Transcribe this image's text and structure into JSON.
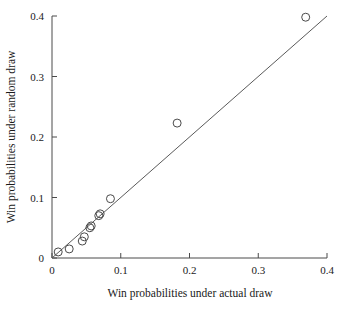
{
  "chart_data": {
    "type": "scatter",
    "title": "",
    "xlabel": "Win probabilities under actual draw",
    "ylabel": "Win probabilities under random draw",
    "xlim": [
      0,
      0.4
    ],
    "ylim": [
      0,
      0.4
    ],
    "xticks": [
      0,
      0.1,
      0.2,
      0.3,
      0.4
    ],
    "yticks": [
      0,
      0.1,
      0.2,
      0.3,
      0.4
    ],
    "xtick_labels": [
      "0",
      "0.1",
      "0.2",
      "0.3",
      "0.4"
    ],
    "ytick_labels": [
      "0",
      "0.1",
      "0.2",
      "0.3",
      "0.4"
    ],
    "grid": false,
    "legend": false,
    "marker": "open-circle",
    "series": [
      {
        "name": "teams",
        "points": [
          {
            "x": 0.009,
            "y": 0.01
          },
          {
            "x": 0.025,
            "y": 0.015
          },
          {
            "x": 0.044,
            "y": 0.028
          },
          {
            "x": 0.047,
            "y": 0.035
          },
          {
            "x": 0.055,
            "y": 0.05
          },
          {
            "x": 0.057,
            "y": 0.053
          },
          {
            "x": 0.068,
            "y": 0.07
          },
          {
            "x": 0.07,
            "y": 0.073
          },
          {
            "x": 0.085,
            "y": 0.098
          },
          {
            "x": 0.182,
            "y": 0.223
          },
          {
            "x": 0.369,
            "y": 0.398
          }
        ]
      }
    ],
    "reference_line": {
      "type": "identity",
      "from": {
        "x": 0.0,
        "y": 0.0
      },
      "to": {
        "x": 0.4,
        "y": 0.4
      }
    }
  }
}
